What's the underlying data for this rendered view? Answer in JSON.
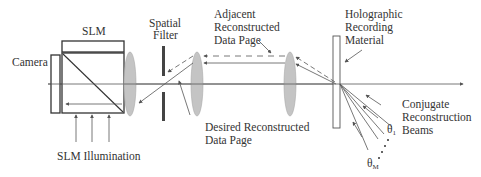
{
  "diagram": {
    "labels": {
      "slm": "SLM",
      "camera": "Camera",
      "spatial_filter": [
        "Spatial",
        "Filter"
      ],
      "adjacent_page": [
        "Adjacent",
        "Reconstructed",
        "Data Page"
      ],
      "holographic_material": [
        "Holographic",
        "Recording",
        "Material"
      ],
      "desired_page": [
        "Desired Reconstructed",
        "Data Page"
      ],
      "slm_illumination": "SLM Illumination",
      "conjugate_beams": [
        "Conjugate",
        "Reconstruction",
        "Beams"
      ],
      "theta_1": {
        "symbol": "θ",
        "subscript": "1"
      },
      "theta_m": {
        "symbol": "θ",
        "subscript": "M"
      },
      "ellipsis": "⋮"
    },
    "components": [
      {
        "id": "camera",
        "type": "detector"
      },
      {
        "id": "slm",
        "type": "spatial-light-modulator"
      },
      {
        "id": "beam-splitter-cube",
        "type": "polarizing-beam-splitter"
      },
      {
        "id": "lens-1",
        "type": "lens"
      },
      {
        "id": "spatial-filter",
        "type": "aperture"
      },
      {
        "id": "lens-2",
        "type": "lens"
      },
      {
        "id": "lens-3",
        "type": "lens"
      },
      {
        "id": "holographic-material",
        "type": "recording-medium"
      }
    ],
    "colors": {
      "lens": "#c4c4c4",
      "line": "#555555",
      "filter": "#444444"
    }
  }
}
